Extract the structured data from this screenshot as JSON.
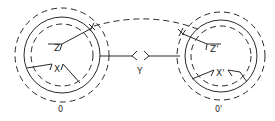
{
  "diagram": {
    "colors": {
      "stroke": "#2a2a2a",
      "background": "#ffffff"
    },
    "left_system": {
      "label": "0",
      "inner_labels": {
        "z": "Z",
        "x": "X"
      }
    },
    "right_system": {
      "label": "0'",
      "inner_labels": {
        "z": "Z'",
        "x": "X'"
      }
    },
    "connector": {
      "label": "Y"
    }
  }
}
